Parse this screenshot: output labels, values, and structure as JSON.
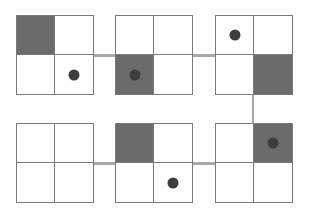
{
  "diagram": {
    "colors": {
      "border": "#7a7a7a",
      "shaded": "#6b6b6b",
      "dot": "#3d3d3d",
      "connector": "#a8a8a8",
      "background": "#ffffff"
    },
    "grids": [
      {
        "id": 1,
        "row": 0,
        "col": 0,
        "shaded": [
          0,
          0
        ],
        "dot": [
          1,
          1
        ]
      },
      {
        "id": 2,
        "row": 0,
        "col": 1,
        "shaded": [
          1,
          0
        ],
        "dot": [
          1,
          0
        ]
      },
      {
        "id": 3,
        "row": 0,
        "col": 2,
        "shaded": [
          1,
          1
        ],
        "dot": [
          0,
          0
        ]
      },
      {
        "id": 4,
        "row": 1,
        "col": 2,
        "shaded": [
          0,
          1
        ],
        "dot": [
          0,
          1
        ]
      },
      {
        "id": 5,
        "row": 1,
        "col": 1,
        "shaded": [
          0,
          0
        ],
        "dot": [
          1,
          1
        ]
      },
      {
        "id": 6,
        "row": 1,
        "col": 0,
        "shaded": null,
        "dot": null
      }
    ],
    "connections": [
      [
        1,
        2
      ],
      [
        2,
        3
      ],
      [
        3,
        4
      ],
      [
        4,
        5
      ],
      [
        5,
        6
      ]
    ]
  }
}
